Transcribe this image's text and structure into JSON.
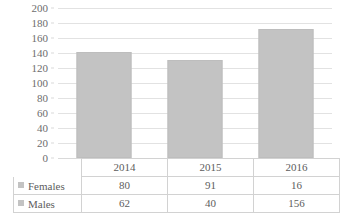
{
  "chart_data": {
    "type": "bar",
    "title": "",
    "subtitle": "",
    "xlabel": "",
    "ylabel": "",
    "categories": [
      "2014",
      "2015",
      "2016"
    ],
    "series": [
      {
        "name": "Females",
        "values": [
          80,
          91,
          16
        ]
      },
      {
        "name": "Males",
        "values": [
          62,
          40,
          156
        ]
      }
    ],
    "bar_totals": [
      142,
      131,
      172
    ],
    "ylim": [
      0,
      200
    ],
    "yticks": [
      0,
      20,
      40,
      60,
      80,
      100,
      120,
      140,
      160,
      180,
      200
    ],
    "ytick_labels": [
      "0",
      "20",
      "40",
      "60",
      "80",
      "100",
      "120",
      "140",
      "160",
      "180",
      "200"
    ],
    "grid": true,
    "legend_position": "data-table-left",
    "bar_color": "#c3c3c3",
    "gridline_color": "#e2e2e2",
    "text_color": "#6d6d6d",
    "table_border_color": "#d2d2d2",
    "has_data_table": true,
    "annotations": []
  },
  "axis": {
    "y_ticks": [
      {
        "label": "200",
        "value": 200
      },
      {
        "label": "180",
        "value": 180
      },
      {
        "label": "160",
        "value": 160
      },
      {
        "label": "140",
        "value": 140
      },
      {
        "label": "120",
        "value": 120
      },
      {
        "label": "100",
        "value": 100
      },
      {
        "label": "80",
        "value": 80
      },
      {
        "label": "60",
        "value": 60
      },
      {
        "label": "40",
        "value": 40
      },
      {
        "label": "20",
        "value": 20
      },
      {
        "label": "0",
        "value": 0
      }
    ]
  },
  "bars": [
    {
      "category": "2014",
      "total": 142
    },
    {
      "category": "2015",
      "total": 131
    },
    {
      "category": "2016",
      "total": 172
    }
  ],
  "table": {
    "corner_label": "",
    "header_row": [
      "2014",
      "2015",
      "2016"
    ],
    "rows": [
      {
        "legend": "Females",
        "cells": [
          "80",
          "91",
          "16"
        ]
      },
      {
        "legend": "Males",
        "cells": [
          "62",
          "40",
          "156"
        ]
      }
    ]
  }
}
